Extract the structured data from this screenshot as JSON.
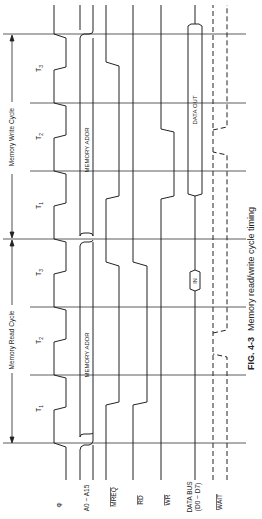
{
  "figure": {
    "caption_number": "FIG. 4-3",
    "caption_text": "Memory read/write cycle timing"
  },
  "cycles": {
    "read": {
      "label": "Memory Read Cycle",
      "states": [
        "T1",
        "T2",
        "T3"
      ]
    },
    "write": {
      "label": "Memory Write Cycle",
      "states": [
        "T1",
        "T2",
        "T3"
      ]
    }
  },
  "signals": [
    {
      "id": "clk",
      "label": "Φ"
    },
    {
      "id": "addr",
      "label": "A0 ~ A15"
    },
    {
      "id": "mreq",
      "label": "MREQ",
      "active_low": true
    },
    {
      "id": "rd",
      "label": "RD",
      "active_low": true
    },
    {
      "id": "wr",
      "label": "WR",
      "active_low": true
    },
    {
      "id": "data",
      "label": "DATA BUS",
      "sublabel": "(D0 ~ D7)"
    },
    {
      "id": "wait",
      "label": "WAIT",
      "active_low": true
    }
  ],
  "bus_annotations": {
    "addr_read": "MEMORY ADDR",
    "addr_write": "MEMORY ADDR",
    "data_read": "IN",
    "data_write": "DATA OUT"
  },
  "state_labels": {
    "t1_main": "T",
    "t1_sub": "1",
    "t2_main": "T",
    "t2_sub": "2",
    "t3_main": "T",
    "t3_sub": "3"
  },
  "colors": {
    "line": "#222222",
    "grid": "#333333",
    "background": "#ffffff"
  }
}
